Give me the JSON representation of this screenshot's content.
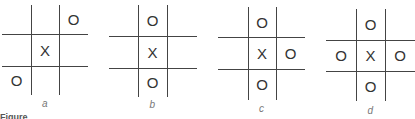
{
  "boards": [
    {
      "label": "a",
      "cells": [
        "",
        "",
        "O",
        "",
        "X",
        "",
        "O",
        "",
        ""
      ]
    },
    {
      "label": "b",
      "cells": [
        "",
        "O",
        "",
        "",
        "X",
        "",
        "",
        "O",
        ""
      ]
    },
    {
      "label": "c",
      "cells": [
        "",
        "O",
        "",
        "",
        "X",
        "O",
        "",
        "O",
        ""
      ]
    },
    {
      "label": "d",
      "cells": [
        "",
        "O",
        "",
        "O",
        "X",
        "O",
        "",
        "O",
        ""
      ]
    }
  ],
  "caption": "Figure"
}
